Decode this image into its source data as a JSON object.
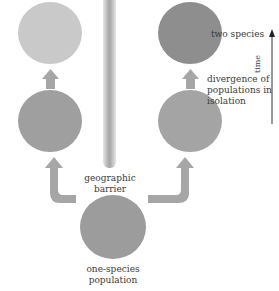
{
  "diagram": {
    "nodes": {
      "top_left": {
        "color": "#c9c9c9"
      },
      "top_right": {
        "color": "#8e8e8e"
      },
      "mid_left": {
        "color": "#9f9f9f"
      },
      "mid_right": {
        "color": "#a4a4a4"
      },
      "bottom": {
        "color": "#9c9c9c"
      }
    },
    "labels": {
      "two_species": "two species",
      "divergence_line1": "divergence of",
      "divergence_line2": "populations in",
      "divergence_line3": "isolation",
      "barrier_line1": "geographic",
      "barrier_line2": "barrier",
      "origin_line1": "one-species",
      "origin_line2": "population",
      "time_axis": "time"
    },
    "arrow_color": "#a6a6a6",
    "axis_color": "#333333"
  }
}
